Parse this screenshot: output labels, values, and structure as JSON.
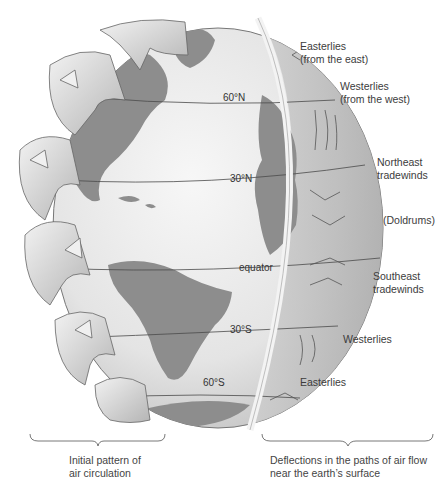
{
  "diagram": {
    "latitudes": {
      "n60": "60°N",
      "n30": "30°N",
      "equator": "equator",
      "s30": "30°S",
      "s60": "60°S"
    },
    "wind_labels": {
      "easterlies_north": "Easterlies",
      "easterlies_north_sub": "(from the east)",
      "westerlies_north": "Westerlies",
      "westerlies_north_sub": "(from the west)",
      "ne_trades_1": "Northeast",
      "ne_trades_2": "tradewinds",
      "doldrums": "(Doldrums)",
      "se_trades_1": "Southeast",
      "se_trades_2": "tradewinds",
      "westerlies_south": "Westerlies",
      "easterlies_south": "Easterlies"
    },
    "captions": {
      "left_1": "Initial pattern of",
      "left_2": "air circulation",
      "right_1": "Deflections in the paths of air flow",
      "right_2": "near the earth’s surface"
    },
    "colors": {
      "ocean": "#e8e8e8",
      "land": "#8a8a8a",
      "cells": "#d9d9d9",
      "outline": "#555555"
    }
  }
}
